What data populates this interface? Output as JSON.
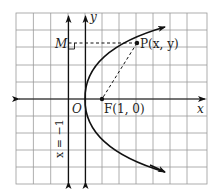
{
  "diagram": {
    "type": "parabola-focus-directrix",
    "equation": "y^2 = 4x",
    "grid": {
      "left": 16,
      "top": 13,
      "right": 207,
      "bottom": 184,
      "cell": 17.2,
      "color": "#9a9a9a"
    },
    "origin_px": [
      85,
      99
    ],
    "unit_px": 17,
    "curve_color": "#111111",
    "labels": {
      "y_axis": "y",
      "x_axis": "x",
      "origin": "O",
      "focus": "F(1, 0)",
      "point": "P(x, y)",
      "foot": "M",
      "directrix": "x = −1"
    },
    "points": {
      "focus": [
        1,
        0
      ],
      "P": [
        3,
        3.3
      ],
      "M": [
        -1,
        3.3
      ]
    }
  }
}
